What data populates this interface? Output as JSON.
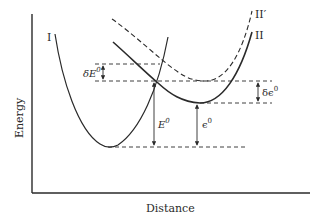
{
  "diagram": {
    "title": "",
    "axes": {
      "x_label": "Distance",
      "y_label": "Energy"
    },
    "curves": [
      {
        "id": "I",
        "label": "I",
        "style": "solid"
      },
      {
        "id": "II",
        "label": "II",
        "style": "solid"
      },
      {
        "id": "II_prime",
        "label": "II′",
        "style": "dashed"
      }
    ],
    "quantities": {
      "delta_E0": {
        "base": "δE",
        "sup": "0"
      },
      "E0": {
        "base": "E",
        "sup": "0"
      },
      "epsilon0": {
        "base": "ϵ",
        "sup": "0"
      },
      "delta_epsilon0": {
        "base": "δϵ",
        "sup": "0"
      }
    },
    "colors": {
      "ink": "#2a2a2a",
      "background": "#ffffff"
    }
  }
}
